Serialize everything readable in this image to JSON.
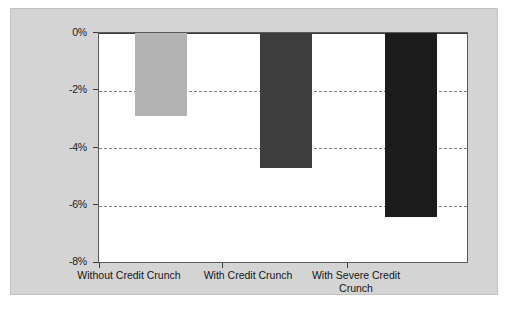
{
  "chart_data": {
    "type": "bar",
    "title": "",
    "subtitle": "",
    "xlabel": "",
    "ylabel": "",
    "categories": [
      "Without Credit Crunch",
      "With Credit Crunch",
      "With Severe Credit Crunch"
    ],
    "values": [
      -2.9,
      -4.7,
      -6.4
    ],
    "series": [
      {
        "name": "",
        "values": [
          -2.9,
          -4.7,
          -6.4
        ],
        "colors": [
          "#b3b3b3",
          "#3d3d3d",
          "#1c1c1c"
        ]
      }
    ],
    "ylim": [
      -8,
      0
    ],
    "ytick_values": [
      0,
      -2,
      -4,
      -6,
      -8
    ],
    "ytick_labels": [
      "0%",
      "-2%",
      "-4%",
      "-6%",
      "-8%"
    ],
    "grid": true,
    "grid_axis": "y",
    "legend": false,
    "legend_position": "none",
    "value_format": "percent",
    "bar_colors": {
      "without_credit_crunch": "#b3b3b3",
      "with_credit_crunch": "#3d3d3d",
      "with_severe_credit_crunch": "#1c1c1c"
    },
    "figure_background": "#d4d4d4",
    "plot_background": "#ffffff",
    "axis_color": "#3c3c3c",
    "gridline_color": "#7f7f7f"
  }
}
